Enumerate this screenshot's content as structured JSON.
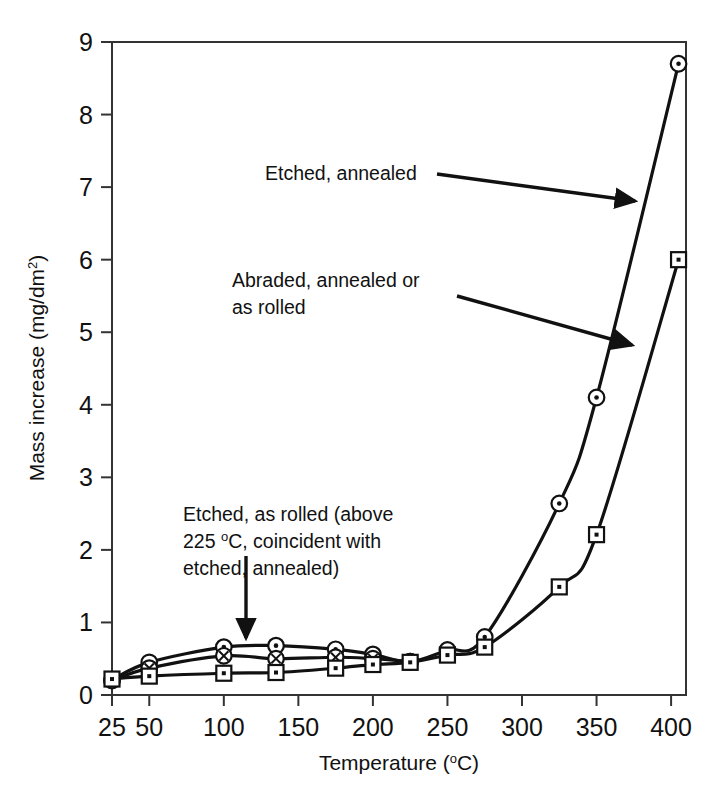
{
  "chart_data": {
    "type": "line",
    "title": "",
    "xlabel": "Temperature (°C)",
    "ylabel": "Mass increase (mg/dm²)",
    "xlim": [
      25,
      410
    ],
    "ylim": [
      0,
      9
    ],
    "xticks": [
      25,
      50,
      100,
      150,
      200,
      250,
      300,
      350,
      400
    ],
    "xtick_labels": [
      "25",
      "50",
      "100",
      "150",
      "200",
      "250",
      "300",
      "350",
      "400"
    ],
    "yticks": [
      0,
      1,
      2,
      3,
      4,
      5,
      6,
      7,
      8,
      9
    ],
    "ytick_labels": [
      "0",
      "1",
      "2",
      "3",
      "4",
      "5",
      "6",
      "7",
      "8",
      "9"
    ],
    "grid": false,
    "legend": "none (annotated with arrows)",
    "series": [
      {
        "name": "Etched, annealed",
        "marker": "circle-dot",
        "x": [
          25,
          50,
          100,
          135,
          175,
          200,
          225,
          250,
          275,
          325,
          350,
          405
        ],
        "y": [
          0.21,
          0.45,
          0.66,
          0.68,
          0.63,
          0.56,
          0.46,
          0.62,
          0.8,
          2.64,
          4.1,
          8.7
        ]
      },
      {
        "name": "Etched, as rolled",
        "marker": "circle-cross",
        "x": [
          25,
          50,
          100,
          135,
          175,
          200,
          225
        ],
        "y": [
          0.2,
          0.37,
          0.54,
          0.5,
          0.52,
          0.5,
          0.46
        ]
      },
      {
        "name": "Abraded, annealed or as rolled",
        "marker": "square-dot",
        "x": [
          25,
          50,
          100,
          135,
          175,
          200,
          225,
          250,
          275,
          325,
          350,
          405
        ],
        "y": [
          0.22,
          0.26,
          0.3,
          0.31,
          0.37,
          0.42,
          0.45,
          0.55,
          0.66,
          1.49,
          2.21,
          6.0
        ]
      }
    ],
    "annotations": [
      {
        "id": "etched-annealed",
        "text": "Etched, annealed",
        "text_x": 265,
        "text_y": 180,
        "arrow_from": [
          437,
          174
        ],
        "arrow_to": [
          635,
          201
        ]
      },
      {
        "id": "abraded-annealed-or-as-rolled",
        "text_line1": "Abraded, annealed or",
        "text_line2": "as rolled",
        "text_x": 232,
        "text_y": 287,
        "arrow_from": [
          457,
          296
        ],
        "arrow_to": [
          632,
          345
        ]
      },
      {
        "id": "etched-as-rolled",
        "text_line1": "Etched, as rolled (above",
        "text_line2_pre": "225 ",
        "text_line2_sup": "o",
        "text_line2_post": "C, coincident with",
        "text_line3": "etched, annealed)",
        "text_x": 183,
        "text_y": 521,
        "arrow_from": [
          246,
          556
        ],
        "arrow_to": [
          246,
          638
        ]
      }
    ]
  },
  "axis": {
    "x_title": "Temperature (°C)",
    "x_title_pre": "Temperature (",
    "x_title_sup": "o",
    "x_title_post": "C)",
    "y_title_pre": "Mass increase (mg/dm",
    "y_title_sup": "2",
    "y_title_post": ")"
  },
  "colors": {
    "line": "#111111",
    "frame": "#333333",
    "background": "#ffffff",
    "marker_fill": "#ffffff"
  }
}
